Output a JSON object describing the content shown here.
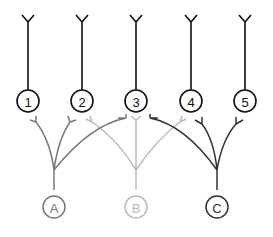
{
  "diagram": {
    "top_nodes": [
      {
        "label": "1"
      },
      {
        "label": "2"
      },
      {
        "label": "3"
      },
      {
        "label": "4"
      },
      {
        "label": "5"
      }
    ],
    "bottom_nodes": [
      {
        "label": "A",
        "color": "#777777"
      },
      {
        "label": "B",
        "color": "#bbbbbb"
      },
      {
        "label": "C",
        "color": "#333333"
      }
    ],
    "colors": {
      "top": "#111111",
      "A": "#777777",
      "B": "#bbbbbb",
      "C": "#333333"
    }
  }
}
